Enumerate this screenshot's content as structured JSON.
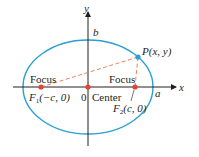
{
  "colors": {
    "ellipse": "#2a9fd0",
    "axes": "#231f20",
    "focus_point": "#e0452e",
    "point_p": "#2a9fd0",
    "dashed_line": "#e8845f",
    "background": "#ffffff"
  },
  "axes": {
    "x_label": "x",
    "y_label": "y"
  },
  "labels": {
    "b": "b",
    "a": "a",
    "point_p": "P(x, y)",
    "focus_left": "Focus",
    "focus_right": "Focus",
    "f1_name": "F",
    "f1_sub": "1",
    "f1_coords": "(−c, 0)",
    "f2_name": "F",
    "f2_sub": "2",
    "f2_coords": "(c, 0)",
    "origin": "0",
    "center": "Center"
  },
  "points": [
    {
      "name": "F1",
      "x": "-c",
      "y": "0"
    },
    {
      "name": "Center",
      "x": "0",
      "y": "0"
    },
    {
      "name": "F2",
      "x": "c",
      "y": "0"
    },
    {
      "name": "P",
      "x": "x",
      "y": "y"
    }
  ]
}
